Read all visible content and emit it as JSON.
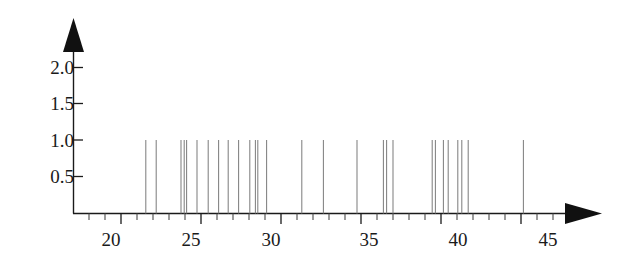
{
  "chart_data": {
    "type": "bar",
    "title": "",
    "subtitle": "",
    "xlabel": "",
    "ylabel": "",
    "grid": false,
    "legend": null,
    "annotations": [],
    "axis_style": "arrow-tipped axes, spike (needle) plot",
    "xlim": [
      18.0,
      46.5
    ],
    "ylim": [
      0,
      2.35
    ],
    "x_major_ticks": [
      20,
      25,
      30,
      35,
      40,
      45
    ],
    "x_major_tick_labels": [
      "20",
      "25",
      "30",
      "35",
      "40",
      "45"
    ],
    "x_minor_tick_step": 1,
    "y_major_ticks": [
      0.5,
      1.0,
      1.5,
      2.0
    ],
    "y_major_tick_labels": [
      "0.5",
      "1.0",
      "1.5",
      "2.0"
    ],
    "series_name": "counts",
    "bar_value": 1.0,
    "categories": [
      21.55,
      22.2,
      23.75,
      23.95,
      24.1,
      24.75,
      25.45,
      26.1,
      26.7,
      27.35,
      28.05,
      28.4,
      28.55,
      29.1,
      31.3,
      32.65,
      34.75,
      36.4,
      36.6,
      37.0,
      39.45,
      39.65,
      40.15,
      40.45,
      41.05,
      41.3,
      41.7,
      45.15
    ],
    "values": [
      1,
      1,
      1,
      1,
      1,
      1,
      1,
      1,
      1,
      1,
      1,
      1,
      1,
      1,
      1,
      1,
      1,
      1,
      1,
      1,
      1,
      1,
      1,
      1,
      1,
      1,
      1,
      1
    ],
    "n_points": 28
  },
  "axes": {
    "y_labels": [
      "2.0",
      "1.5",
      "1.0",
      "0.5"
    ],
    "x_labels": [
      "20",
      "25",
      "30",
      "35",
      "40",
      "45"
    ]
  },
  "icons": {
    "y_axis_arrow": "arrow-up-icon",
    "x_axis_arrow": "arrow-right-icon"
  },
  "colors": {
    "background": "#ffffff",
    "axis": "#1a1a1a",
    "spike": "#808080",
    "text": "#1a1a1a"
  }
}
